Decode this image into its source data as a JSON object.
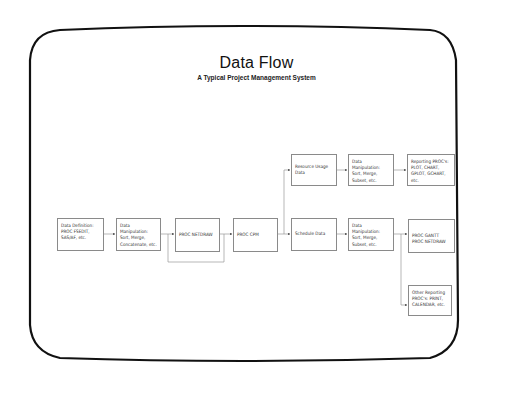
{
  "header": {
    "title": "Data Flow",
    "subtitle": "A Typical Project Management System"
  },
  "nodes": [
    {
      "id": "data-definition",
      "label": "Data Definition:\nPROC FSEDIT,\nSAS/AF, etc."
    },
    {
      "id": "data-manipulation-1",
      "label": "Data Manipulation:\nSort, Merge,\nConcatenate, etc."
    },
    {
      "id": "proc-netdraw",
      "label": "PROC NETDRAW"
    },
    {
      "id": "proc-cpm",
      "label": "PROC CPM"
    },
    {
      "id": "resource-usage-data",
      "label": "Resource Usage\nData"
    },
    {
      "id": "schedule-data",
      "label": "Schedule Data"
    },
    {
      "id": "data-manipulation-2",
      "label": "Data Manipulation:\nSort, Merge,\nSubset, etc."
    },
    {
      "id": "data-manipulation-3",
      "label": "Data Manipulation:\nSort, Merge,\nSubset, etc."
    },
    {
      "id": "reporting-procs",
      "label": "Reporting PROC's:\nPLOT, CHART,\nGPLOT, GCHART, etc."
    },
    {
      "id": "proc-gantt-netdraw",
      "label": "PROC GANTT\nPROC NETDRAW"
    },
    {
      "id": "other-reporting",
      "label": "Other Reporting\nPROC's: PRINT,\nCALENDAR, etc."
    }
  ],
  "edges": [
    {
      "from": "data-definition",
      "to": "data-manipulation-1"
    },
    {
      "from": "data-manipulation-1",
      "to": "proc-netdraw"
    },
    {
      "from": "data-manipulation-1",
      "to": "proc-cpm",
      "route": "loop-below"
    },
    {
      "from": "proc-netdraw",
      "to": "proc-cpm"
    },
    {
      "from": "proc-cpm",
      "to": "resource-usage-data"
    },
    {
      "from": "proc-cpm",
      "to": "schedule-data"
    },
    {
      "from": "resource-usage-data",
      "to": "data-manipulation-2"
    },
    {
      "from": "data-manipulation-2",
      "to": "reporting-procs"
    },
    {
      "from": "schedule-data",
      "to": "data-manipulation-3"
    },
    {
      "from": "data-manipulation-3",
      "to": "proc-gantt-netdraw"
    },
    {
      "from": "data-manipulation-3",
      "to": "other-reporting"
    }
  ],
  "colors": {
    "frame": "#111111",
    "box_border": "#8a8a8a",
    "connector": "#9a9a9a",
    "arrowhead": "#555555"
  }
}
